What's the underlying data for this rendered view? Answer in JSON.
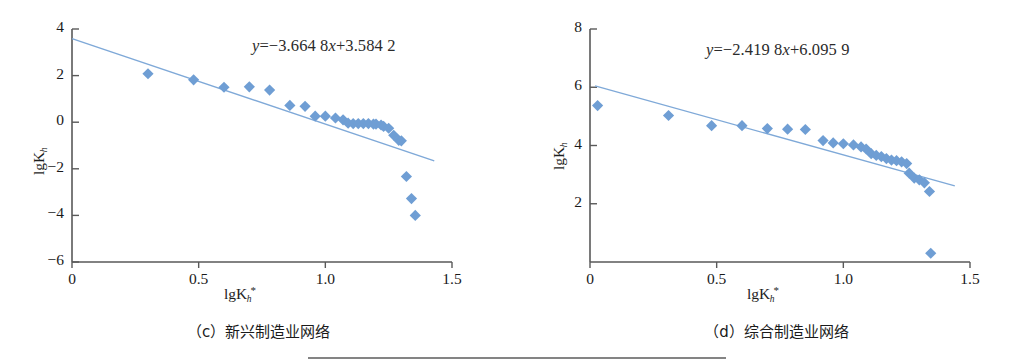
{
  "figure": {
    "background": "#ffffff",
    "marker_color": "#6f9ed4",
    "line_color": "#7fa9d8",
    "axis_color": "#595959",
    "text_color": "#1a1a1a"
  },
  "panels": [
    {
      "id": "c",
      "caption": "（c）新兴制造业网络",
      "equation": {
        "full": "y=−3.664 8x+3.584 2",
        "lhs": "y",
        "eq": "=",
        "slope_text": "−3.664 8",
        "x_sym": "x",
        "plus": "+",
        "intercept_text": "3.584 2"
      },
      "axis": {
        "xlabel_main": "lgK",
        "xlabel_sub": "h",
        "xlabel_sup": "*",
        "ylabel_main": "lgK",
        "ylabel_sub": "h",
        "xticks": [
          "0",
          "0.5",
          "1.0",
          "1.5"
        ],
        "xtick_values": [
          0,
          0.5,
          1.0,
          1.5
        ],
        "yticks": [
          "4",
          "2",
          "0",
          "−2",
          "−4",
          "−6"
        ],
        "ytick_values": [
          4,
          2,
          0,
          -2,
          -4,
          -6
        ],
        "xlim": [
          0,
          1.5
        ],
        "ylim": [
          -6,
          4
        ]
      }
    },
    {
      "id": "d",
      "caption": "（d）综合制造业网络",
      "equation": {
        "full": "y=−2.419 8x+6.095 9",
        "lhs": "y",
        "eq": "=",
        "slope_text": "−2.419 8",
        "x_sym": "x",
        "plus": "+",
        "intercept_text": "6.095 9"
      },
      "axis": {
        "xlabel_main": "lgK",
        "xlabel_sub": "h",
        "xlabel_sup": "*",
        "ylabel_main": "lgK",
        "ylabel_sub": "h",
        "xticks": [
          "0",
          "0.5",
          "1.0",
          "1.5"
        ],
        "xtick_values": [
          0,
          0.5,
          1.0,
          1.5
        ],
        "yticks": [
          "8",
          "6",
          "4",
          "2"
        ],
        "ytick_values": [
          8,
          6,
          4,
          2
        ],
        "xlim": [
          0,
          1.5
        ],
        "ylim": [
          0,
          8
        ]
      }
    }
  ],
  "chart_data": [
    {
      "type": "scatter",
      "panel": "c",
      "title": "（c）新兴制造业网络",
      "xlabel": "lgK_h*",
      "ylabel": "lgK_h",
      "xlim": [
        0,
        1.5
      ],
      "ylim": [
        -6,
        4
      ],
      "xticks": [
        0,
        0.5,
        1.0,
        1.5
      ],
      "yticks": [
        4,
        2,
        0,
        -2,
        -4,
        -6
      ],
      "grid": false,
      "legend": "none",
      "annotation": "y=−3.664 8x+3.584 2",
      "series": [
        {
          "name": "observed",
          "marker": "diamond",
          "color": "#6f9ed4",
          "x": [
            0.3,
            0.48,
            0.6,
            0.7,
            0.78,
            0.86,
            0.92,
            0.96,
            1.0,
            1.04,
            1.07,
            1.09,
            1.11,
            1.13,
            1.15,
            1.17,
            1.19,
            1.2,
            1.22,
            1.23,
            1.25,
            1.27,
            1.29,
            1.3,
            1.32,
            1.34
          ],
          "y": [
            2.08,
            1.82,
            1.5,
            1.52,
            1.38,
            0.72,
            0.68,
            0.26,
            0.26,
            0.18,
            0.1,
            -0.04,
            -0.06,
            -0.06,
            -0.06,
            -0.06,
            -0.08,
            -0.08,
            -0.12,
            -0.18,
            -0.26,
            -0.56,
            -0.78,
            -0.8,
            -2.33,
            -3.28
          ]
        },
        {
          "name": "observed-tail",
          "marker": "diamond",
          "color": "#6f9ed4",
          "x": [
            1.355
          ],
          "y": [
            -4.0
          ]
        },
        {
          "name": "fit-line",
          "type": "line",
          "color": "#7fa9d8",
          "slope": -3.6648,
          "intercept": 3.5842,
          "x_range": [
            0,
            1.43
          ]
        }
      ]
    },
    {
      "type": "scatter",
      "panel": "d",
      "title": "（d）综合制造业网络",
      "xlabel": "lgK_h*",
      "ylabel": "lgK_h",
      "xlim": [
        0,
        1.5
      ],
      "ylim": [
        0,
        8
      ],
      "xticks": [
        0,
        0.5,
        1.0,
        1.5
      ],
      "yticks": [
        8,
        6,
        4,
        2
      ],
      "grid": false,
      "legend": "none",
      "annotation": "y=−2.419 8x+6.095 9",
      "series": [
        {
          "name": "observed",
          "marker": "diamond",
          "color": "#6f9ed4",
          "x": [
            0.03,
            0.31,
            0.48,
            0.6,
            0.7,
            0.78,
            0.85,
            0.92,
            0.96,
            1.0,
            1.04,
            1.07,
            1.09,
            1.11,
            1.13,
            1.15,
            1.17,
            1.19,
            1.21,
            1.23,
            1.25,
            1.26,
            1.28,
            1.3,
            1.32,
            1.34
          ],
          "y": [
            5.37,
            5.03,
            4.68,
            4.68,
            4.58,
            4.56,
            4.55,
            4.17,
            4.09,
            4.06,
            4.02,
            3.95,
            3.88,
            3.72,
            3.66,
            3.62,
            3.55,
            3.5,
            3.48,
            3.44,
            3.38,
            3.05,
            2.88,
            2.82,
            2.72,
            2.42
          ]
        },
        {
          "name": "low-outlier",
          "marker": "diamond",
          "color": "#6f9ed4",
          "x": [
            1.345
          ],
          "y": [
            0.3
          ]
        },
        {
          "name": "fit-line",
          "type": "line",
          "color": "#7fa9d8",
          "slope": -2.4198,
          "intercept": 6.0959,
          "x_range": [
            0.02,
            1.44
          ]
        }
      ]
    }
  ]
}
